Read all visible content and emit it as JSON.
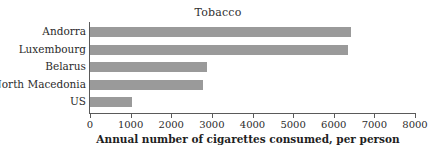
{
  "chart_data": {
    "type": "bar",
    "orientation": "horizontal",
    "title": "Tobacco",
    "xlabel": "Annual number of cigarettes consumed, per person",
    "ylabel": "",
    "categories": [
      "Andorra",
      "Luxembourg",
      "Belarus",
      "North Macedonia",
      "US"
    ],
    "values": [
      6420,
      6350,
      2880,
      2780,
      1030
    ],
    "xlim": [
      0,
      8000
    ],
    "xticks": [
      0,
      1000,
      2000,
      3000,
      4000,
      5000,
      6000,
      7000,
      8000
    ],
    "xtick_labels": [
      "0",
      "1000",
      "2000",
      "3000",
      "4000",
      "5000",
      "6000",
      "7000",
      "8000"
    ],
    "grid": false,
    "legend": null,
    "bar_color": "#9a9a9a",
    "axis_color": "#5a5a5a",
    "background_color": "#ffffff"
  }
}
